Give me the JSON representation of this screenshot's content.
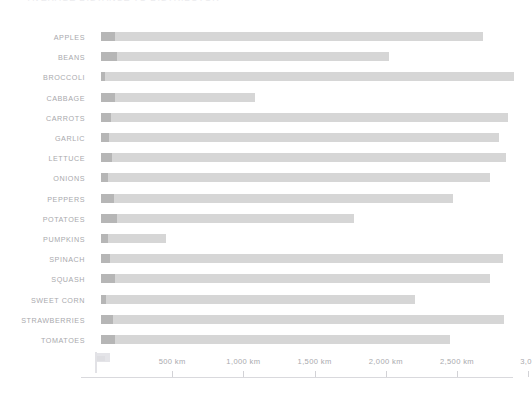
{
  "chart": {
    "title": "AVERAGE DISTANCE TO DISTRIBUTOR",
    "origin_marker_icon": "flag-icon"
  },
  "axis": {
    "ticks": [
      {
        "label": "500 km",
        "value": 500
      },
      {
        "label": "1,000 km",
        "value": 1000
      },
      {
        "label": "1,500 km",
        "value": 1500
      },
      {
        "label": "2,000 km",
        "value": 2000
      },
      {
        "label": "2,500 km",
        "value": 2500
      },
      {
        "label": "3,0",
        "value": 3000
      }
    ]
  },
  "colors": {
    "bar_dark": "#b6b6b6",
    "bar_light": "#d6d6d6",
    "label_text": "#a9a9ad",
    "axis_line": "#d9d9dd",
    "background": "#ffffff"
  },
  "chart_data": {
    "type": "bar",
    "orientation": "horizontal",
    "stacked": true,
    "title": "AVERAGE DISTANCE TO DISTRIBUTOR",
    "xlabel": "",
    "ylabel": "",
    "xlim": [
      0,
      2900
    ],
    "grid": false,
    "legend": "none",
    "unit": "km",
    "categories": [
      "APPLES",
      "BEANS",
      "BROCCOLI",
      "CABBAGE",
      "CARROTS",
      "GARLIC",
      "LETTUCE",
      "ONIONS",
      "PEPPERS",
      "POTATOES",
      "PUMPKINS",
      "SPINACH",
      "SQUASH",
      "SWEET CORN",
      "STRAWBERRIES",
      "TOMATOES"
    ],
    "series": [
      {
        "name": "local",
        "values": [
          100,
          110,
          28,
          95,
          70,
          55,
          75,
          50,
          90,
          115,
          50,
          60,
          100,
          35,
          85,
          95
        ]
      },
      {
        "name": "distant",
        "values": [
          2580,
          1910,
          2870,
          990,
          2790,
          2740,
          2770,
          2680,
          2380,
          1665,
          410,
          2760,
          2630,
          2170,
          2745,
          2355
        ]
      }
    ],
    "totals": [
      2680,
      2020,
      2898,
      1085,
      2860,
      2795,
      2845,
      2730,
      2470,
      1780,
      460,
      2820,
      2730,
      2205,
      2830,
      2450
    ]
  }
}
